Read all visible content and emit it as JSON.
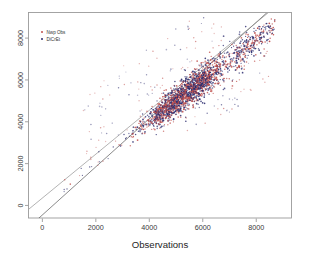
{
  "figure": {
    "background_color": "#ffffff",
    "frame_color": "#9a9a9a"
  },
  "legend": {
    "position": "top-left",
    "entries": [
      {
        "label": "Nwp Obs",
        "color": "#c0504d",
        "marker": "dot"
      },
      {
        "label": "DiCrEt",
        "color": "#2c2c6e",
        "marker": "dot"
      }
    ]
  },
  "chart_data": {
    "type": "scatter",
    "title": "",
    "subtitle": "",
    "xlabel": "Observations",
    "ylabel": "",
    "xlim": [
      -500,
      9300
    ],
    "ylim": [
      -600,
      9200
    ],
    "xticks": [
      0,
      2000,
      4000,
      6000,
      8000
    ],
    "xtick_labels": [
      "0",
      "2000",
      "4000",
      "6000",
      "8000"
    ],
    "yticks": [
      0,
      2000,
      4000,
      6000,
      8000
    ],
    "ytick_labels": [
      "0",
      "2000",
      "4000",
      "6000",
      "8000"
    ],
    "ytick_label_rotation": -90,
    "grid": false,
    "legend_position": "top-left",
    "annotations": [],
    "reference_lines": [
      {
        "name": "identity-line",
        "description": "1:1 identity line y = x",
        "slope": 1,
        "intercept": 0,
        "color": "#4a4a4a",
        "width": 0.6
      },
      {
        "name": "regression-line",
        "description": "fitted regression line, offset above identity",
        "slope": 0.925,
        "intercept": 620,
        "color": "#8a8a8a",
        "width": 0.6
      }
    ],
    "series": [
      {
        "name": "Nwp Obs",
        "color": "#c0504d",
        "marker": "dot",
        "marker_size": 1.0,
        "n_points": 620,
        "description": "Red/salmon points distributed along the 1:1 diagonal between roughly 2500 and 8500, densest near 4500-6000"
      },
      {
        "name": "DiCrEt",
        "color": "#2c2c6e",
        "marker": "dot",
        "marker_size": 1.0,
        "n_points": 780,
        "description": "Navy points distributed along the 1:1 diagonal between roughly 2500 and 8500, densest near 4500-6000, with sparse high outliers above the band"
      }
    ]
  }
}
